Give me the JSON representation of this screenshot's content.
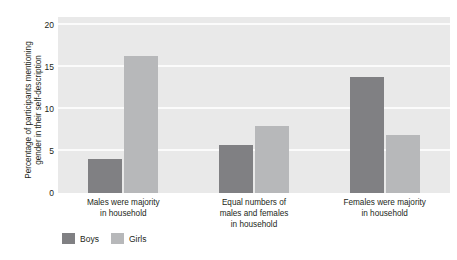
{
  "chart_data": {
    "type": "bar",
    "title": "",
    "subtitle": "",
    "xlabel": "",
    "ylabel": "Percentage of participants mentioning gender in their self-description",
    "ylabel_line1": "Percentage of participants mentioning",
    "ylabel_line2": "gender in their self-description",
    "categories": [
      "Males were majority in household",
      "Equal numbers of males and females in household",
      "Females were majority in household"
    ],
    "category_lines": [
      [
        "Males were majority",
        "in household"
      ],
      [
        "Equal numbers of",
        "males and females",
        "in household"
      ],
      [
        "Females were majority",
        "in household"
      ]
    ],
    "series": [
      {
        "name": "Boys",
        "color": "#808083",
        "values": [
          4.1,
          5.7,
          13.8
        ]
      },
      {
        "name": "Girls",
        "color": "#b7b8ba",
        "values": [
          16.3,
          8.0,
          6.9
        ]
      }
    ],
    "ylim": [
      0,
      21
    ],
    "yticks": [
      0,
      5,
      10,
      15,
      20
    ],
    "ytick_labels": [
      "0",
      "5",
      "10",
      "15",
      "20"
    ],
    "grid": true,
    "grid_color": "#fbfbfb",
    "plot_background": "#e9e9e9",
    "legend_position": "bottom-left"
  },
  "legend": {
    "entries": [
      {
        "label": "Boys",
        "color": "#808083"
      },
      {
        "label": "Girls",
        "color": "#b7b8ba"
      }
    ]
  }
}
